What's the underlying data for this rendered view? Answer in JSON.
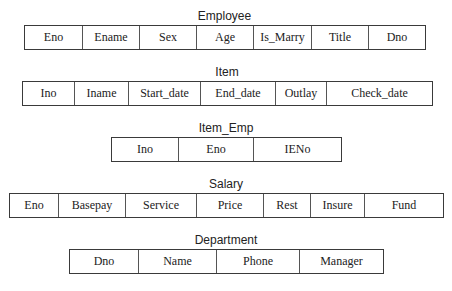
{
  "tables": {
    "employee": {
      "title": "Employee",
      "fields": [
        "Eno",
        "Ename",
        "Sex",
        "Age",
        "Is_Marry",
        "Title",
        "Dno"
      ]
    },
    "item": {
      "title": "Item",
      "fields": [
        "Ino",
        "Iname",
        "Start_date",
        "End_date",
        "Outlay",
        "Check_date"
      ]
    },
    "item_emp": {
      "title": "Item_Emp",
      "fields": [
        "Ino",
        "Eno",
        "IENo"
      ]
    },
    "salary": {
      "title": "Salary",
      "fields": [
        "Eno",
        "Basepay",
        "Service",
        "Price",
        "Rest",
        "Insure",
        "Fund"
      ]
    },
    "department": {
      "title": "Department",
      "fields": [
        "Dno",
        "Name",
        "Phone",
        "Manager"
      ]
    }
  },
  "colors": {
    "border": "#3a3a3a",
    "text": "#222222",
    "background": "#ffffff"
  }
}
